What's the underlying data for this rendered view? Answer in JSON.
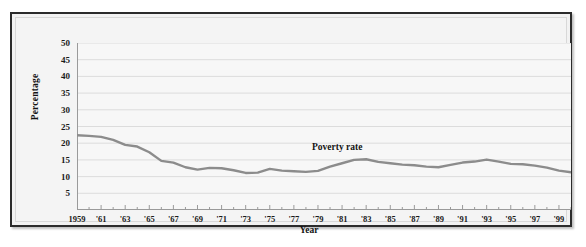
{
  "figure": {
    "background_color": "#ffffff",
    "frame_color": "#2b2b2b",
    "plot_background_color": "#f7f7f7",
    "gridline_color": "#dcdcdc",
    "axis_color": "#9a9a9a",
    "series_color": "#8c8c8c"
  },
  "chart_data": {
    "type": "line",
    "title": "",
    "xlabel": "Year",
    "ylabel": "Percentage",
    "xlim": [
      1959,
      2000
    ],
    "ylim": [
      0,
      50
    ],
    "yticks": [
      5,
      10,
      15,
      20,
      25,
      30,
      35,
      40,
      45,
      50
    ],
    "ytick_labels": [
      "5",
      "10",
      "15",
      "20",
      "25",
      "30",
      "35",
      "40",
      "45",
      "50"
    ],
    "xtick_labels": [
      "1959",
      "'61",
      "'63",
      "'65",
      "'67",
      "'69",
      "'71",
      "'73",
      "'75",
      "'77",
      "'79",
      "'81",
      "'83",
      "'85",
      "'87",
      "'89",
      "'91",
      "'93",
      "'95",
      "'97",
      "'99"
    ],
    "xticks": [
      1959,
      1961,
      1963,
      1965,
      1967,
      1969,
      1971,
      1973,
      1975,
      1977,
      1979,
      1981,
      1983,
      1985,
      1987,
      1989,
      1991,
      1993,
      1995,
      1997,
      1999
    ],
    "grid": "horizontal",
    "legend_position": "inline-annotation",
    "annotations": [
      {
        "text": "Poverty rate",
        "x": 1981,
        "y": 18.5
      }
    ],
    "series": [
      {
        "name": "Poverty rate",
        "color": "#8c8c8c",
        "x": [
          1959,
          1960,
          1961,
          1962,
          1963,
          1964,
          1965,
          1966,
          1967,
          1968,
          1969,
          1970,
          1971,
          1972,
          1973,
          1974,
          1975,
          1976,
          1977,
          1978,
          1979,
          1980,
          1981,
          1982,
          1983,
          1984,
          1985,
          1986,
          1987,
          1988,
          1989,
          1990,
          1991,
          1992,
          1993,
          1994,
          1995,
          1996,
          1997,
          1998,
          1999,
          2000
        ],
        "values": [
          22.4,
          22.2,
          21.9,
          21.0,
          19.5,
          19.0,
          17.3,
          14.7,
          14.2,
          12.8,
          12.1,
          12.6,
          12.5,
          11.9,
          11.1,
          11.2,
          12.3,
          11.8,
          11.6,
          11.4,
          11.7,
          13.0,
          14.0,
          15.0,
          15.2,
          14.4,
          14.0,
          13.6,
          13.4,
          13.0,
          12.8,
          13.5,
          14.2,
          14.5,
          15.1,
          14.5,
          13.8,
          13.7,
          13.3,
          12.7,
          11.8,
          11.3
        ]
      }
    ]
  }
}
